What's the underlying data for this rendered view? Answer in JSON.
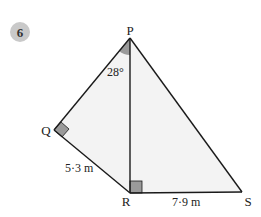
{
  "question": {
    "number": "6",
    "badge_color": "#c9c9c9"
  },
  "diagram": {
    "fill_color": "#f3f3f3",
    "line_color": "#1a1a1a",
    "marker_color": "#9a9a9a",
    "vertices": {
      "P": {
        "label": "P",
        "x": 130,
        "y": 38
      },
      "Q": {
        "label": "Q",
        "x": 54,
        "y": 130
      },
      "R": {
        "label": "R",
        "x": 130,
        "y": 193
      },
      "S": {
        "label": "S",
        "x": 242,
        "y": 192
      }
    },
    "angle_label": "28°",
    "side_QR": "5·3 m",
    "side_RS": "7·9 m",
    "right_angles": [
      "Q",
      "R"
    ]
  }
}
